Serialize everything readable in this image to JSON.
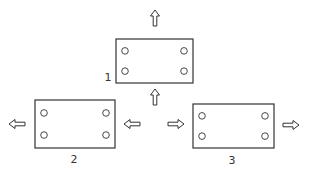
{
  "diagram": {
    "type": "plate-movement-schematic",
    "stroke_color": "#333333",
    "plates": [
      {
        "id": "plate-1",
        "label": "1",
        "x": 116,
        "y": 39,
        "w": 77,
        "h": 44,
        "label_pos": {
          "x": 108,
          "y": 81
        }
      },
      {
        "id": "plate-2",
        "label": "2",
        "x": 35,
        "y": 100,
        "w": 80,
        "h": 48,
        "label_pos": {
          "x": 74,
          "y": 163
        }
      },
      {
        "id": "plate-3",
        "label": "3",
        "x": 193,
        "y": 104,
        "w": 81,
        "h": 44,
        "label_pos": {
          "x": 232,
          "y": 164
        }
      }
    ],
    "arrows": [
      {
        "id": "arrow-up-top",
        "direction": "up",
        "x": 155,
        "y": 18
      },
      {
        "id": "arrow-up-middle",
        "direction": "up",
        "x": 155,
        "y": 97
      },
      {
        "id": "arrow-left-outer",
        "direction": "left",
        "x": 17,
        "y": 124
      },
      {
        "id": "arrow-left-inner",
        "direction": "left",
        "x": 132,
        "y": 124
      },
      {
        "id": "arrow-right-inner",
        "direction": "right",
        "x": 176,
        "y": 124
      },
      {
        "id": "arrow-right-outer",
        "direction": "right",
        "x": 291,
        "y": 125
      }
    ]
  }
}
